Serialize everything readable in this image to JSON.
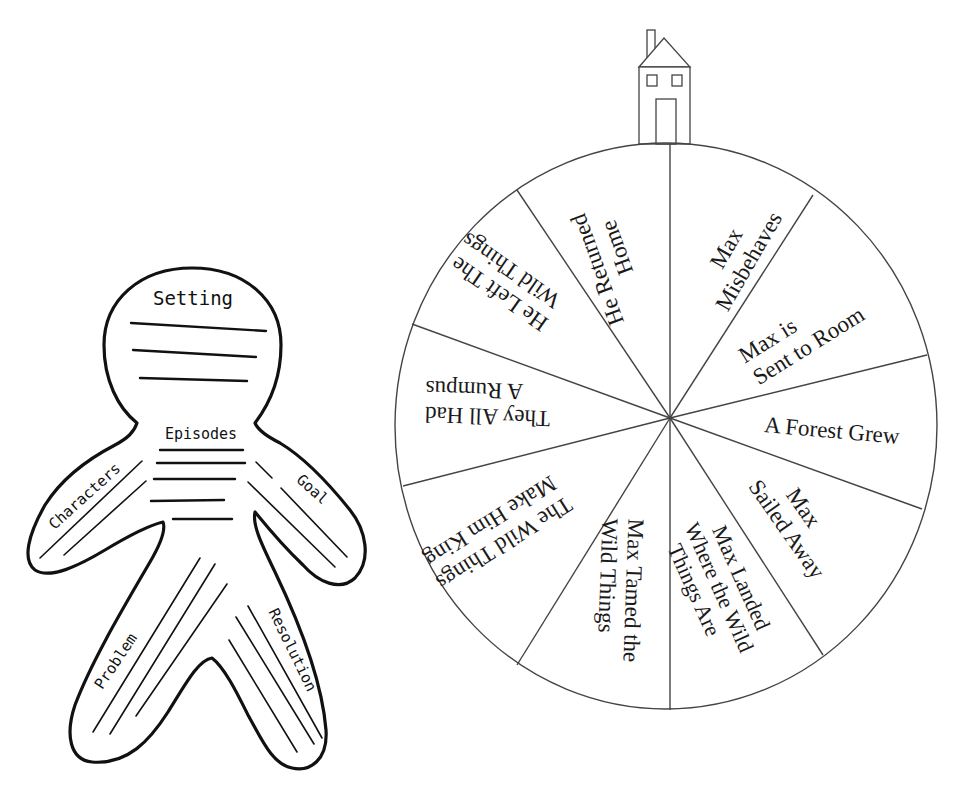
{
  "story_figure": {
    "head_label": "Setting",
    "body_label": "Episodes",
    "left_arm_label": "Characters",
    "right_arm_label": "Goal",
    "left_leg_label": "Problem",
    "right_leg_label": "Resolution",
    "head_lines": 3,
    "body_lines": 5
  },
  "story_wheel": {
    "house_icon": "house-icon",
    "segments": [
      {
        "lines": [
          "Max",
          "Misbehaves"
        ]
      },
      {
        "lines": [
          "Max is",
          "Sent to Room"
        ]
      },
      {
        "lines": [
          "A Forest Grew"
        ]
      },
      {
        "lines": [
          "Max",
          "Sailed Away"
        ]
      },
      {
        "lines": [
          "Max Landed",
          "Where the Wild",
          "Things Are"
        ]
      },
      {
        "lines": [
          "Max Tamed the",
          "Wild Things"
        ]
      },
      {
        "lines": [
          "The Wild Things",
          "Make Him King"
        ]
      },
      {
        "lines": [
          "They All Had",
          "A Rumpus"
        ]
      },
      {
        "lines": [
          "He Left The",
          "Wild Things"
        ]
      },
      {
        "lines": [
          "He Returned",
          "Home"
        ]
      }
    ]
  }
}
